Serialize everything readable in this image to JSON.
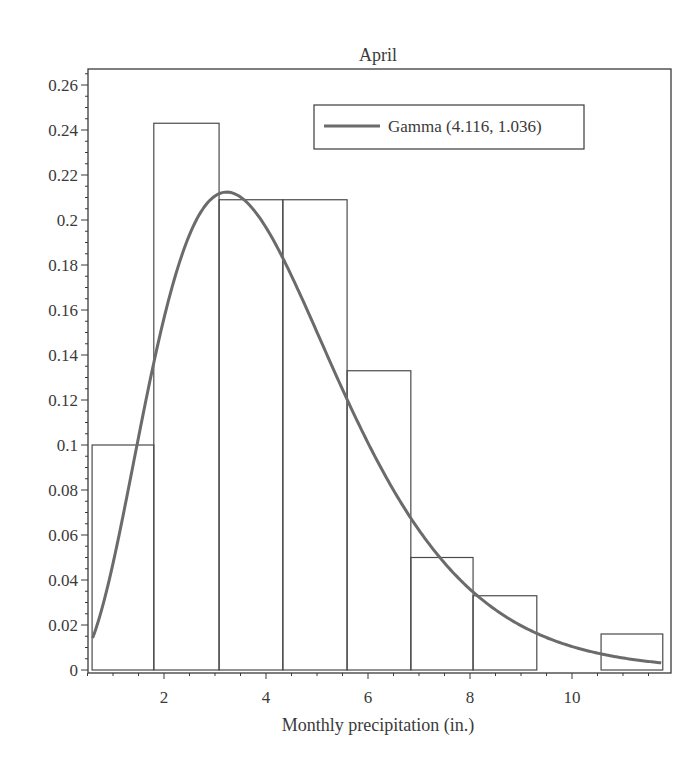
{
  "chart_data": {
    "type": "bar",
    "subtype": "histogram with fitted density curve",
    "title": "April",
    "xlabel": "Monthly precipitation (in.)",
    "ylabel": "",
    "xlim": [
      0.51,
      11.94
    ],
    "ylim": [
      0,
      0.267
    ],
    "x_ticks": [
      2,
      4,
      6,
      8,
      10
    ],
    "y_ticks": [
      0,
      0.02,
      0.04,
      0.06,
      0.08,
      0.1,
      0.12,
      0.14,
      0.16,
      0.18,
      0.2,
      0.22,
      0.24,
      0.26
    ],
    "y_tick_labels": [
      "0",
      "0.02",
      "0.04",
      "0.06",
      "0.08",
      "0.1",
      "0.12",
      "0.14",
      "0.16",
      "0.18",
      "0.2",
      "0.22",
      "0.24",
      "0.26"
    ],
    "grid": false,
    "bins": [
      {
        "x0": 0.59,
        "x1": 1.8,
        "density": 0.1
      },
      {
        "x0": 1.8,
        "x1": 3.08,
        "density": 0.243
      },
      {
        "x0": 3.08,
        "x1": 4.33,
        "density": 0.209
      },
      {
        "x0": 4.33,
        "x1": 5.59,
        "density": 0.209
      },
      {
        "x0": 5.59,
        "x1": 6.84,
        "density": 0.133
      },
      {
        "x0": 6.84,
        "x1": 8.06,
        "density": 0.05
      },
      {
        "x0": 8.06,
        "x1": 9.31,
        "density": 0.033
      },
      {
        "x0": 9.31,
        "x1": 10.57,
        "density": 0.0
      },
      {
        "x0": 10.57,
        "x1": 11.78,
        "density": 0.016
      }
    ],
    "series": [
      {
        "name": "Gamma (4.116, 1.036)",
        "type": "line",
        "distribution": "gamma",
        "shape": 4.116,
        "scale": 1.036,
        "x_range": [
          0.6,
          11.75
        ],
        "peak": {
          "x": 3.23,
          "y": 0.264
        }
      }
    ],
    "legend": {
      "position": "top-right",
      "entries": [
        "Gamma (4.116, 1.036)"
      ]
    }
  },
  "colors": {
    "curve": "#6b6b6b",
    "bars": "#4a4a4a",
    "axis": "#3a3a3a",
    "text": "#3a3a3a"
  }
}
